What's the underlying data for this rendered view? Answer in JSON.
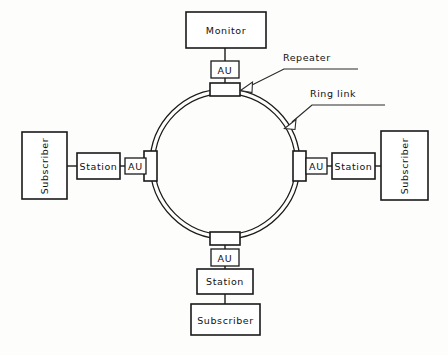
{
  "figure": {
    "background_color": "#fdfdfc",
    "line_color": "#1a1a1a"
  },
  "nodes": {
    "monitor": {
      "label": "Monitor"
    },
    "top_au": {
      "label": "AU"
    },
    "left_au": {
      "label": "AU"
    },
    "right_au": {
      "label": "AU"
    },
    "bottom_au": {
      "label": "AU"
    },
    "left_station": {
      "label": "Station"
    },
    "right_station": {
      "label": "Station"
    },
    "bottom_station": {
      "label": "Station"
    },
    "left_subscriber": {
      "label": "Subscriber"
    },
    "right_subscriber": {
      "label": "Subscriber"
    },
    "bottom_subscriber": {
      "label": "Subscriber"
    }
  },
  "annotations": {
    "repeater": {
      "label": "Repeater"
    },
    "ring_link": {
      "label": "Ring link"
    }
  },
  "repeaters": [
    {
      "position": "top"
    },
    {
      "position": "right"
    },
    {
      "position": "bottom"
    },
    {
      "position": "left"
    }
  ],
  "ring": {
    "center_x": 225,
    "center_y": 164,
    "outer_radius": 75,
    "inner_radius": 71
  }
}
